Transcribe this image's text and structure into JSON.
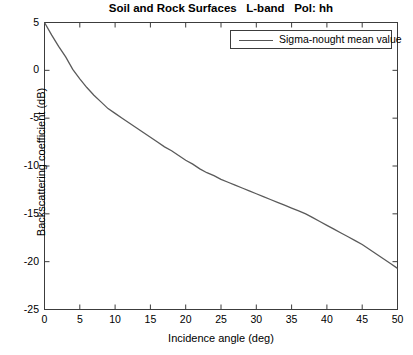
{
  "chart_data": {
    "type": "line",
    "title": "Soil and Rock Surfaces   L-band   Pol: hh",
    "xlabel": "Incidence angle (deg)",
    "ylabel": "Backscattering coefficient (dB)",
    "xlim": [
      0,
      50
    ],
    "ylim": [
      -25,
      5
    ],
    "xticks": [
      0,
      5,
      10,
      15,
      20,
      25,
      30,
      35,
      40,
      45,
      50
    ],
    "yticks": [
      -25,
      -20,
      -15,
      -10,
      -5,
      0,
      5
    ],
    "xticklabels": [
      "0",
      "5",
      "10",
      "15",
      "20",
      "25",
      "30",
      "35",
      "40",
      "45",
      "50"
    ],
    "yticklabels": [
      "-25",
      "-20",
      "-15",
      "-10",
      "-5",
      "0",
      "5"
    ],
    "grid": false,
    "legend_position": "upper right",
    "series": [
      {
        "name": "Sigma-nought mean value",
        "color": "#5a5a5a",
        "x": [
          0,
          1,
          2,
          3,
          4,
          5,
          6,
          7,
          8,
          9,
          10,
          11,
          12,
          13,
          14,
          15,
          16,
          17,
          18,
          19,
          20,
          21,
          22,
          23,
          24,
          25,
          26,
          27,
          28,
          29,
          30,
          31,
          32,
          33,
          34,
          35,
          36,
          37,
          38,
          39,
          40,
          41,
          42,
          43,
          44,
          45,
          46,
          47,
          48,
          49,
          50
        ],
        "values": [
          5.0,
          3.7,
          2.5,
          1.4,
          0.1,
          -0.9,
          -1.8,
          -2.6,
          -3.3,
          -4.0,
          -4.5,
          -5.0,
          -5.5,
          -6.0,
          -6.5,
          -7.0,
          -7.5,
          -8.0,
          -8.4,
          -8.9,
          -9.4,
          -9.8,
          -10.3,
          -10.7,
          -11.0,
          -11.4,
          -11.7,
          -12.0,
          -12.3,
          -12.6,
          -12.9,
          -13.2,
          -13.5,
          -13.8,
          -14.1,
          -14.4,
          -14.7,
          -15.0,
          -15.4,
          -15.8,
          -16.2,
          -16.6,
          -17.0,
          -17.4,
          -17.8,
          -18.2,
          -18.7,
          -19.2,
          -19.7,
          -20.2,
          -20.7
        ]
      }
    ]
  },
  "legend": {
    "entries": [
      {
        "label": "Sigma-nought mean value"
      }
    ]
  }
}
